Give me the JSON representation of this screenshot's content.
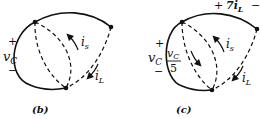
{
  "figures": [
    {
      "id": "b",
      "caption": "(b)",
      "nodes": [
        {
          "name": "top",
          "x": 35,
          "y": 22
        },
        {
          "name": "right",
          "x": 111,
          "y": 27
        },
        {
          "name": "bottom",
          "x": 66,
          "y": 88
        }
      ],
      "labels": {
        "vc_plus": "+",
        "vc_v": "v",
        "vc_sub": "C",
        "vc_minus": "−",
        "is_i": "i",
        "is_sub": "s",
        "il_i": "i",
        "il_sub": "L"
      }
    },
    {
      "id": "c",
      "caption": "(c)",
      "nodes": [
        {
          "name": "top",
          "x": 182,
          "y": 22
        },
        {
          "name": "right",
          "x": 257,
          "y": 29
        },
        {
          "name": "bottom",
          "x": 212,
          "y": 90
        }
      ],
      "labels": {
        "vc_plus": "+",
        "vc_v": "v",
        "vc_sub": "C",
        "vc_minus": "−",
        "frac_num_v": "v",
        "frac_num_sub": "C",
        "frac_den": "5",
        "is_i": "i",
        "is_sub": "s",
        "il_i": "i",
        "il_sub": "L",
        "top_plus": "+",
        "top_value": "7i",
        "top_sub": "L",
        "top_minus": "−"
      }
    }
  ],
  "colors": {
    "stroke": "#111111",
    "background": "#ffffff"
  }
}
